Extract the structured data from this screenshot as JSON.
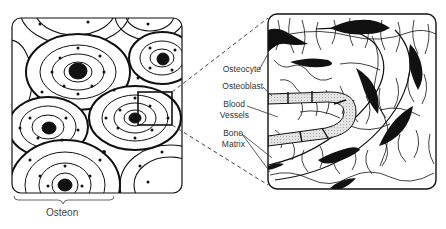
{
  "diagram": {
    "left_panel": {
      "name": "osteon-cross-section",
      "caption": "Osteon"
    },
    "right_panel": {
      "name": "magnified-detail"
    },
    "labels": {
      "osteocyte": "Osteocyte",
      "osteoblast": "Osteoblast",
      "blood_vessels_1": "Blood",
      "blood_vessels_2": "Vessels",
      "bone_matrix_1": "Bone",
      "bone_matrix_2": "Matrix"
    },
    "colors": {
      "ink": "#111111",
      "vessel_fill": "#d8d8d8",
      "label": "#333333"
    }
  }
}
